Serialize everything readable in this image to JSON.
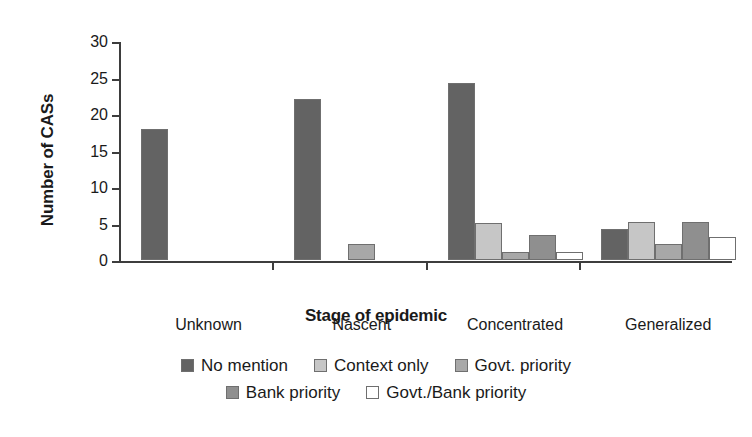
{
  "chart_data": {
    "type": "bar",
    "title": "",
    "xlabel": "Stage of epidemic",
    "ylabel": "Number of CASs",
    "categories": [
      "Unknown",
      "Nascent",
      "Concentrated",
      "Generalized"
    ],
    "series": [
      {
        "name": "No mention",
        "color": "#636363",
        "values": [
          18,
          22,
          24.3,
          4.3
        ]
      },
      {
        "name": "Context only",
        "color": "#c6c6c6",
        "values": [
          0,
          0,
          5.1,
          5.2
        ]
      },
      {
        "name": "Govt. priority",
        "color": "#a8a8a8",
        "values": [
          0,
          2.2,
          1.1,
          2.2
        ]
      },
      {
        "name": "Bank priority",
        "color": "#8f8f8f",
        "values": [
          0,
          0,
          3.4,
          5.2
        ]
      },
      {
        "name": "Govt./Bank priority",
        "color": "#ffffff",
        "values": [
          0,
          0,
          1.1,
          3.2
        ]
      }
    ],
    "ylim": [
      0,
      30
    ],
    "yticks": [
      0,
      5,
      10,
      15,
      20,
      25,
      30
    ],
    "ytick_labels": [
      "0",
      "5",
      "10",
      "15",
      "20",
      "25",
      "30"
    ],
    "grid": false,
    "legend_position": "bottom",
    "legend_rows": [
      [
        "No mention",
        "Context only",
        "Govt. priority"
      ],
      [
        "Bank priority",
        "Govt./Bank priority"
      ]
    ],
    "axis_color": "#3d3d3d",
    "bar_edge_color": "#6f6f6f",
    "background": "#ffffff"
  }
}
